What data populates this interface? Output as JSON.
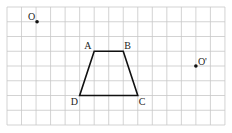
{
  "grid": {
    "cols": 15,
    "rows": 8,
    "origin_x": 7,
    "origin_y": 7,
    "cell_w": 14.53,
    "cell_h": 14.75,
    "line_color": "#c8c8c8"
  },
  "trapezoid": {
    "stroke": "#111111",
    "vertices": [
      {
        "name": "A",
        "col": 6,
        "row": 3
      },
      {
        "name": "B",
        "col": 8,
        "row": 3
      },
      {
        "name": "C",
        "col": 9,
        "row": 6
      },
      {
        "name": "D",
        "col": 5,
        "row": 6
      }
    ]
  },
  "points": [
    {
      "name": "O",
      "col": 2,
      "row": 1
    },
    {
      "name": "O'",
      "col": 13,
      "row": 4
    }
  ],
  "labels": {
    "A": "A",
    "B": "B",
    "C": "C",
    "D": "D",
    "O": "O",
    "O_prime": "O'"
  }
}
